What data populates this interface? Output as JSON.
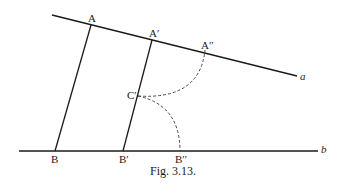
{
  "figure": {
    "caption": "Fig. 3.13.",
    "lines": {
      "a": {
        "label": "a"
      },
      "b": {
        "label": "b"
      }
    },
    "points": {
      "A": "A",
      "A_prime": "A′",
      "A_double_prime": "A′′",
      "C_prime": "C′",
      "B": "B",
      "B_prime": "B′",
      "B_double_prime": "B′′"
    }
  }
}
